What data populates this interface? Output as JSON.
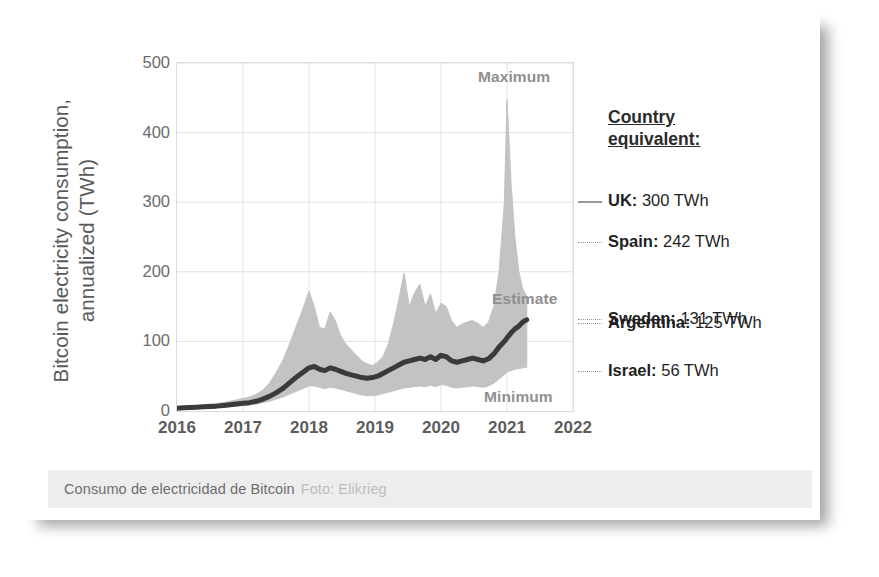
{
  "card": {
    "caption": {
      "main": "Consumo de electricidad de Bitcoin",
      "credit": "Foto: Elikrieg"
    }
  },
  "chart_data": {
    "type": "area",
    "title": "",
    "subtitle": "",
    "xlabel": "",
    "ylabel": "Bitcoin electricity consumption,\nannualized (TWh)",
    "xlim": [
      2016,
      2022
    ],
    "ylim": [
      0,
      500
    ],
    "ytick_labels": [
      "0",
      "100",
      "200",
      "300",
      "400",
      "500"
    ],
    "ytick_values": [
      0,
      100,
      200,
      300,
      400,
      500
    ],
    "xtick_labels": [
      "2016",
      "2017",
      "2018",
      "2019",
      "2020",
      "2021",
      "2022"
    ],
    "xtick_values": [
      2016,
      2017,
      2018,
      2019,
      2020,
      2021,
      2022
    ],
    "grid": true,
    "legend_position": "right-outside",
    "band_color": "#c3c3c3",
    "line_color": "#3a3a3a",
    "annotations": [
      {
        "name": "maximum",
        "label": "Maximum"
      },
      {
        "name": "estimate",
        "label": "Estimate"
      },
      {
        "name": "minimum",
        "label": "Minimum"
      }
    ],
    "x": [
      2016.0,
      2016.1,
      2016.2,
      2016.3,
      2016.4,
      2016.5,
      2016.6,
      2016.7,
      2016.8,
      2016.9,
      2017.0,
      2017.1,
      2017.2,
      2017.3,
      2017.4,
      2017.5,
      2017.6,
      2017.7,
      2017.8,
      2017.9,
      2018.0,
      2018.08,
      2018.16,
      2018.24,
      2018.32,
      2018.4,
      2018.48,
      2018.56,
      2018.64,
      2018.72,
      2018.8,
      2018.88,
      2018.96,
      2019.04,
      2019.12,
      2019.2,
      2019.28,
      2019.36,
      2019.44,
      2019.52,
      2019.6,
      2019.68,
      2019.76,
      2019.84,
      2019.92,
      2020.0,
      2020.08,
      2020.16,
      2020.24,
      2020.32,
      2020.4,
      2020.48,
      2020.56,
      2020.64,
      2020.72,
      2020.8,
      2020.88,
      2020.96,
      2021.0,
      2021.06,
      2021.12,
      2021.18,
      2021.24,
      2021.3
    ],
    "series": [
      {
        "name": "Maximum",
        "values": [
          5,
          6,
          7,
          8,
          9,
          10,
          11,
          12,
          14,
          16,
          18,
          20,
          24,
          30,
          40,
          55,
          72,
          95,
          120,
          145,
          172,
          150,
          120,
          118,
          142,
          130,
          108,
          96,
          88,
          80,
          72,
          68,
          65,
          70,
          78,
          96,
          125,
          160,
          198,
          150,
          170,
          182,
          150,
          168,
          140,
          155,
          150,
          130,
          120,
          125,
          128,
          130,
          126,
          120,
          128,
          150,
          200,
          300,
          448,
          330,
          250,
          200,
          175,
          165
        ]
      },
      {
        "name": "Estimate",
        "values": [
          4,
          4.5,
          5,
          5.5,
          6,
          6.5,
          7,
          8,
          9,
          10,
          11,
          12,
          14,
          17,
          21,
          26,
          32,
          40,
          48,
          55,
          62,
          64,
          60,
          58,
          62,
          60,
          57,
          54,
          52,
          50,
          48,
          47,
          48,
          50,
          54,
          58,
          62,
          66,
          70,
          72,
          74,
          76,
          74,
          78,
          74,
          80,
          78,
          72,
          70,
          72,
          74,
          76,
          74,
          72,
          75,
          82,
          92,
          100,
          105,
          112,
          118,
          122,
          128,
          131
        ]
      },
      {
        "name": "Minimum",
        "values": [
          3,
          3.2,
          3.5,
          3.8,
          4,
          4.5,
          5,
          5.5,
          6,
          7,
          8,
          9,
          10,
          12,
          14,
          17,
          20,
          24,
          28,
          32,
          36,
          36,
          34,
          32,
          34,
          33,
          31,
          29,
          27,
          25,
          23,
          22,
          22,
          23,
          25,
          27,
          29,
          31,
          33,
          34,
          35,
          36,
          35,
          37,
          35,
          38,
          37,
          34,
          33,
          34,
          35,
          36,
          35,
          34,
          36,
          40,
          46,
          52,
          56,
          58,
          60,
          61,
          62,
          63
        ]
      }
    ],
    "reference_lines": [
      {
        "country": "UK",
        "value": 300,
        "unit": "TWh",
        "label": "UK: 300 TWh"
      },
      {
        "country": "Spain",
        "value": 242,
        "unit": "TWh",
        "label": "Spain: 242 TWh"
      },
      {
        "country": "Sweden",
        "value": 131,
        "unit": "TWh",
        "label": "Sweden: 131 TWh"
      },
      {
        "country": "Argentina",
        "value": 125,
        "unit": "TWh",
        "label": "Argentina: 125 TWh"
      },
      {
        "country": "Israel",
        "value": 56,
        "unit": "TWh",
        "label": "Israel: 56 TWh"
      }
    ],
    "legend": {
      "title": "Country\nequivalent:",
      "entries": [
        {
          "country": "UK:",
          "value": "300 TWh"
        },
        {
          "country": "Spain:",
          "value": "242 TWh"
        },
        {
          "country": "Sweden:",
          "value": "131 TWh"
        },
        {
          "country": "Argentina:",
          "value": "125 TWh"
        },
        {
          "country": "Israel:",
          "value": "56 TWh"
        }
      ]
    }
  }
}
